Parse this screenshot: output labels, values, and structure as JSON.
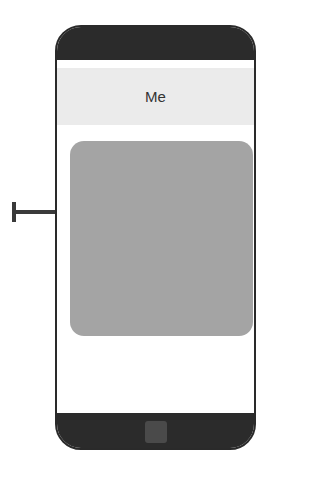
{
  "header": {
    "title": "Me"
  },
  "colors": {
    "device_frame": "#2b2b2b",
    "header_bg": "#ebebeb",
    "content_box": "#a4a4a4",
    "arrow": "#3a3a3a"
  },
  "annotations": {
    "arrow": "pointer-arrow pointing to content area"
  }
}
